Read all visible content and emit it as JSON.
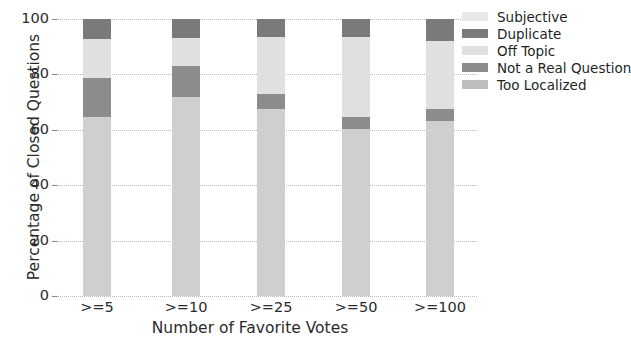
{
  "chart_data": {
    "type": "bar",
    "subtype": "stacked-percentage",
    "title": "",
    "xlabel": "Number of Favorite Votes",
    "ylabel": "Percentage of Closed Questions",
    "categories": [
      ">=5",
      ">=10",
      ">=25",
      ">=50",
      ">=100"
    ],
    "ylim": [
      0,
      100
    ],
    "yticks": [
      0,
      20,
      40,
      60,
      80,
      100
    ],
    "ytick_labels": [
      "0",
      "20",
      "40",
      "60",
      "80",
      "100"
    ],
    "grid": true,
    "legend_position": "upper right",
    "series": [
      {
        "name": "Too Localized",
        "color": "#cfcfcf",
        "values": [
          64.6,
          71.8,
          67.5,
          60.2,
          63.2
        ]
      },
      {
        "name": "Not a Real Question",
        "color": "#8c8c8c",
        "values": [
          14.1,
          11.2,
          5.4,
          4.3,
          4.3
        ]
      },
      {
        "name": "Off Topic",
        "color": "#e0e0e0",
        "values": [
          14.1,
          10.0,
          20.6,
          29.0,
          24.5
        ]
      },
      {
        "name": "Duplicate",
        "color": "#7a7a7a",
        "values": [
          7.2,
          7.0,
          6.5,
          6.5,
          8.0
        ]
      },
      {
        "name": "Subjective",
        "color": "#e8e8e8",
        "values": [
          0.0,
          0.0,
          0.0,
          0.0,
          0.0
        ]
      }
    ],
    "legend": [
      {
        "label": "Subjective",
        "color": "#e8e8e8"
      },
      {
        "label": "Duplicate",
        "color": "#7a7a7a"
      },
      {
        "label": "Off Topic",
        "color": "#e0e0e0"
      },
      {
        "label": "Not a Real Question",
        "color": "#8c8c8c"
      },
      {
        "label": "Too Localized",
        "color": "#bdbdbd"
      }
    ]
  }
}
